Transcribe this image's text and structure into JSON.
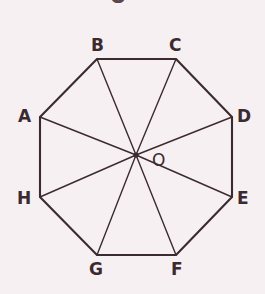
{
  "figure": {
    "type": "regular-octagon-with-radii",
    "background_color": "#f7f0f3",
    "stroke_color": "#3b2b2f",
    "label_color": "#3b2b2f",
    "canvas": {
      "width": 265,
      "height": 294
    },
    "center": {
      "label": "O",
      "x": 136,
      "y": 155,
      "label_x": 152,
      "label_y": 152
    },
    "clipped_top_glyph": "O",
    "vertices": [
      {
        "id": "A",
        "label": "A",
        "x": 40,
        "y": 117,
        "label_x": 18,
        "label_y": 108
      },
      {
        "id": "B",
        "label": "B",
        "x": 97,
        "y": 59,
        "label_x": 91,
        "label_y": 37
      },
      {
        "id": "C",
        "label": "C",
        "x": 176,
        "y": 59,
        "label_x": 169,
        "label_y": 37
      },
      {
        "id": "D",
        "label": "D",
        "x": 232,
        "y": 117,
        "label_x": 237,
        "label_y": 108
      },
      {
        "id": "E",
        "label": "E",
        "x": 232,
        "y": 197,
        "label_x": 237,
        "label_y": 190
      },
      {
        "id": "F",
        "label": "F",
        "x": 176,
        "y": 255,
        "label_x": 171,
        "label_y": 261
      },
      {
        "id": "G",
        "label": "G",
        "x": 97,
        "y": 255,
        "label_x": 89,
        "label_y": 261
      },
      {
        "id": "H",
        "label": "H",
        "x": 40,
        "y": 197,
        "label_x": 17,
        "label_y": 190
      }
    ],
    "perimeter_edges": [
      [
        "A",
        "B"
      ],
      [
        "B",
        "C"
      ],
      [
        "C",
        "D"
      ],
      [
        "D",
        "E"
      ],
      [
        "E",
        "F"
      ],
      [
        "F",
        "G"
      ],
      [
        "G",
        "H"
      ],
      [
        "H",
        "A"
      ]
    ],
    "radii": [
      [
        "O",
        "A"
      ],
      [
        "O",
        "B"
      ],
      [
        "O",
        "C"
      ],
      [
        "O",
        "D"
      ],
      [
        "O",
        "E"
      ],
      [
        "O",
        "F"
      ],
      [
        "O",
        "G"
      ],
      [
        "O",
        "H"
      ]
    ]
  }
}
